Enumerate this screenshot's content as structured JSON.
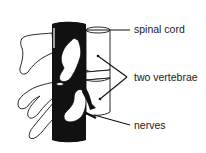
{
  "diagram": {
    "labels": {
      "spinal_cord": "spinal cord",
      "vertebrae": "two vertebrae",
      "nerves": "nerves"
    },
    "colors": {
      "ink": "#111111",
      "background": "#ffffff",
      "cord_fill": "#111111"
    }
  }
}
